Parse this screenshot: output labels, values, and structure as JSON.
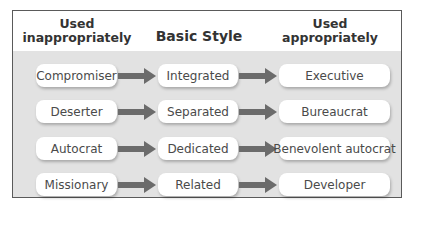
{
  "header": {
    "col1": "Used\ninappropriately",
    "col1_line1": "Used",
    "col1_line2": "inappropriately",
    "col2": "Basic Style",
    "col3_line1": "Used",
    "col3_line2": "appropriately"
  },
  "rows": [
    {
      "inappropriate": "Compromiser",
      "basic": "Integrated",
      "appropriate": "Executive"
    },
    {
      "inappropriate": "Deserter",
      "basic": "Separated",
      "appropriate": "Bureaucrat"
    },
    {
      "inappropriate": "Autocrat",
      "basic": "Dedicated",
      "appropriate": "Benevolent autocrat"
    },
    {
      "inappropriate": "Missionary",
      "basic": "Related",
      "appropriate": "Developer"
    }
  ],
  "colors": {
    "body_bg": "#e2e2e2",
    "arrow": "#6b6b6b",
    "border": "#5a5a5a"
  }
}
